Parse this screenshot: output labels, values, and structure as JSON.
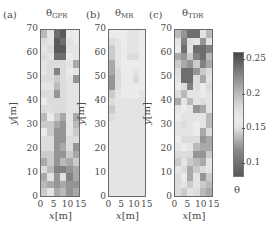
{
  "figure": {
    "panels": [
      {
        "id": "a",
        "label": "(a)",
        "title_main": "θ",
        "title_sub": "GPR"
      },
      {
        "id": "b",
        "label": "(b)",
        "title_main": "θ",
        "title_sub": "MR"
      },
      {
        "id": "c",
        "label": "(c)",
        "title_main": "θ",
        "title_sub": "TDR"
      }
    ],
    "y_ticks": [
      "70",
      "60",
      "50",
      "40",
      "30",
      "20",
      "10",
      "0"
    ],
    "x_ticks": [
      "0",
      "5",
      "10",
      "15"
    ],
    "xlabel_var": "x",
    "xlabel_unit": "[m]",
    "ylabel_var": "y",
    "ylabel_unit": "[m]",
    "colorbar": {
      "label": "θ",
      "ticks": [
        "0.25",
        "0.2",
        "0.15",
        "0.1"
      ],
      "tick_values": [
        0.25,
        0.2,
        0.15,
        0.1
      ],
      "range": [
        0.08,
        0.26
      ]
    }
  },
  "chart_data": {
    "type": "heatmap",
    "xlabel": "x[m]",
    "ylabel": "y[m]",
    "xlim": [
      0,
      15
    ],
    "ylim": [
      0,
      70
    ],
    "x_ticks": [
      0,
      5,
      10,
      15
    ],
    "y_ticks": [
      0,
      10,
      20,
      30,
      40,
      50,
      60,
      70
    ],
    "colorbar_label": "θ",
    "colorbar_range": [
      0.08,
      0.26
    ],
    "colorbar_ticks": [
      0.1,
      0.15,
      0.2,
      0.25
    ],
    "grid_note": "rows listed from top (y≈70) to bottom (y≈0); 6 columns from x=0 to x=15",
    "series": [
      {
        "name": "θGPR",
        "values": [
          [
            0.2,
            0.17,
            0.24,
            0.25,
            0.16,
            0.16
          ],
          [
            0.18,
            0.17,
            0.25,
            0.24,
            0.17,
            0.16
          ],
          [
            0.17,
            0.18,
            0.25,
            0.25,
            0.17,
            0.17
          ],
          [
            0.18,
            0.17,
            0.24,
            0.24,
            0.16,
            0.17
          ],
          [
            0.17,
            0.18,
            0.18,
            0.18,
            0.17,
            0.21
          ],
          [
            0.17,
            0.18,
            0.23,
            0.18,
            0.16,
            0.17
          ],
          [
            0.18,
            0.18,
            0.19,
            0.18,
            0.17,
            0.22
          ],
          [
            0.17,
            0.17,
            0.2,
            0.18,
            0.17,
            0.17
          ],
          [
            0.18,
            0.18,
            0.22,
            0.18,
            0.17,
            0.17
          ],
          [
            0.16,
            0.18,
            0.18,
            0.18,
            0.17,
            0.17
          ],
          [
            0.18,
            0.15,
            0.18,
            0.18,
            0.17,
            0.17
          ],
          [
            0.2,
            0.16,
            0.19,
            0.21,
            0.17,
            0.21
          ],
          [
            0.19,
            0.19,
            0.21,
            0.22,
            0.17,
            0.2
          ],
          [
            0.16,
            0.19,
            0.22,
            0.22,
            0.17,
            0.19
          ],
          [
            0.18,
            0.18,
            0.22,
            0.22,
            0.18,
            0.18
          ],
          [
            0.18,
            0.18,
            0.22,
            0.21,
            0.18,
            0.22
          ],
          [
            0.19,
            0.19,
            0.22,
            0.22,
            0.19,
            0.21
          ],
          [
            0.21,
            0.19,
            0.22,
            0.2,
            0.21,
            0.19
          ],
          [
            0.18,
            0.2,
            0.23,
            0.23,
            0.22,
            0.21
          ],
          [
            0.21,
            0.17,
            0.22,
            0.15,
            0.23,
            0.21
          ],
          [
            0.2,
            0.21,
            0.22,
            0.21,
            0.22,
            0.22
          ],
          [
            0.19,
            0.17,
            0.21,
            0.2,
            0.22,
            0.21
          ]
        ]
      },
      {
        "name": "θMR",
        "values": [
          [
            0.16,
            0.16,
            0.16,
            0.17,
            0.17,
            0.16
          ],
          [
            0.18,
            0.17,
            0.16,
            0.17,
            0.17,
            0.16
          ],
          [
            0.19,
            0.17,
            0.16,
            0.17,
            0.17,
            0.16
          ],
          [
            0.19,
            0.17,
            0.16,
            0.18,
            0.18,
            0.16
          ],
          [
            0.21,
            0.17,
            0.16,
            0.16,
            0.16,
            0.16
          ],
          [
            0.21,
            0.18,
            0.16,
            0.16,
            0.17,
            0.16
          ],
          [
            0.22,
            0.18,
            0.16,
            0.16,
            0.18,
            0.16
          ],
          [
            0.22,
            0.18,
            0.16,
            0.16,
            0.16,
            0.16
          ],
          [
            0.19,
            0.17,
            0.16,
            0.16,
            0.16,
            0.17
          ],
          [
            0.18,
            0.17,
            0.17,
            0.17,
            0.17,
            0.17
          ],
          [
            0.19,
            0.17,
            0.17,
            0.17,
            0.17,
            0.17
          ],
          [
            0.18,
            0.17,
            0.17,
            0.17,
            0.17,
            0.17
          ],
          [
            0.17,
            0.17,
            0.17,
            0.17,
            0.17,
            0.17
          ],
          [
            0.17,
            0.17,
            0.17,
            0.17,
            0.17,
            0.17
          ],
          [
            0.17,
            0.17,
            0.17,
            0.17,
            0.17,
            0.17
          ],
          [
            0.17,
            0.17,
            0.17,
            0.17,
            0.17,
            0.17
          ],
          [
            0.17,
            0.17,
            0.17,
            0.17,
            0.17,
            0.17
          ],
          [
            0.17,
            0.17,
            0.17,
            0.17,
            0.17,
            0.17
          ],
          [
            0.17,
            0.17,
            0.17,
            0.17,
            0.17,
            0.17
          ],
          [
            0.17,
            0.17,
            0.17,
            0.17,
            0.17,
            0.17
          ],
          [
            0.17,
            0.17,
            0.17,
            0.17,
            0.17,
            0.17
          ],
          [
            0.17,
            0.17,
            0.17,
            0.17,
            0.17,
            0.17
          ]
        ]
      },
      {
        "name": "θTDR",
        "values": [
          [
            0.2,
            0.22,
            0.24,
            0.24,
            0.17,
            0.2
          ],
          [
            0.17,
            0.23,
            0.18,
            0.17,
            0.22,
            0.17
          ],
          [
            0.16,
            0.24,
            0.17,
            0.24,
            0.24,
            0.23
          ],
          [
            0.21,
            0.22,
            0.19,
            0.23,
            0.24,
            0.2
          ],
          [
            0.19,
            0.21,
            0.22,
            0.19,
            0.23,
            0.21
          ],
          [
            0.18,
            0.24,
            0.24,
            0.22,
            0.19,
            0.18
          ],
          [
            0.17,
            0.24,
            0.24,
            0.18,
            0.21,
            0.17
          ],
          [
            0.16,
            0.18,
            0.23,
            0.18,
            0.16,
            0.18
          ],
          [
            0.18,
            0.2,
            0.17,
            0.17,
            0.16,
            0.17
          ],
          [
            0.21,
            0.17,
            0.2,
            0.17,
            0.18,
            0.17
          ],
          [
            0.17,
            0.16,
            0.17,
            0.22,
            0.21,
            0.17
          ],
          [
            0.16,
            0.17,
            0.17,
            0.17,
            0.17,
            0.2
          ],
          [
            0.17,
            0.18,
            0.17,
            0.16,
            0.17,
            0.2
          ],
          [
            0.17,
            0.17,
            0.17,
            0.16,
            0.21,
            0.18
          ],
          [
            0.16,
            0.18,
            0.18,
            0.18,
            0.22,
            0.21
          ],
          [
            0.17,
            0.16,
            0.17,
            0.2,
            0.21,
            0.21
          ],
          [
            0.18,
            0.18,
            0.18,
            0.22,
            0.22,
            0.19
          ],
          [
            0.19,
            0.17,
            0.19,
            0.2,
            0.21,
            0.17
          ],
          [
            0.17,
            0.18,
            0.21,
            0.19,
            0.18,
            0.17
          ],
          [
            0.18,
            0.16,
            0.21,
            0.17,
            0.22,
            0.19
          ],
          [
            0.18,
            0.17,
            0.19,
            0.17,
            0.19,
            0.2
          ],
          [
            0.18,
            0.19,
            0.17,
            0.18,
            0.2,
            0.21
          ]
        ]
      }
    ]
  }
}
